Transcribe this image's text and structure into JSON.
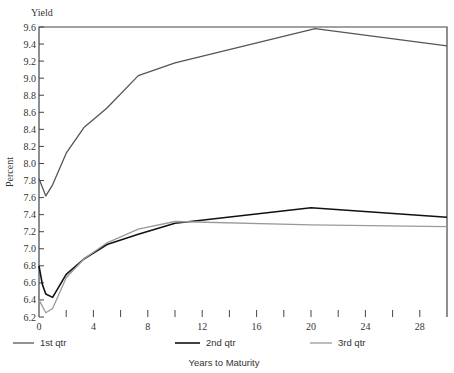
{
  "chart_data": {
    "type": "line",
    "title": "",
    "ylabel_top": "Yield",
    "ylabel": "Percent",
    "xlabel": "Years to Maturity",
    "xlim": [
      0,
      30
    ],
    "ylim": [
      6.2,
      9.6
    ],
    "x_ticks": [
      0,
      2,
      4,
      6,
      8,
      10,
      12,
      14,
      16,
      18,
      20,
      22,
      24,
      26,
      28
    ],
    "x_tick_labels": [
      "0",
      "4",
      "8",
      "12",
      "16",
      "20",
      "24",
      "28"
    ],
    "x_tick_label_values": [
      0,
      4,
      8,
      12,
      16,
      20,
      24,
      28
    ],
    "y_ticks": [
      6.2,
      6.4,
      6.6,
      6.8,
      7.0,
      7.2,
      7.4,
      7.6,
      7.8,
      8.0,
      8.2,
      8.4,
      8.6,
      8.8,
      9.0,
      9.2,
      9.4,
      9.6
    ],
    "y_tick_labels": [
      "6.2",
      "6.4",
      "6.6",
      "6.8",
      "7.0",
      "7.2",
      "7.4",
      "7.6",
      "7.8",
      "8.0",
      "8.2",
      "8.4",
      "8.6",
      "8.8",
      "9.0",
      "9.2",
      "9.4",
      "9.6"
    ],
    "grid": false,
    "legend_position": "bottom",
    "series": [
      {
        "name": "1st qtr",
        "color": "#555555",
        "width": 1.3,
        "points": [
          [
            0,
            7.82
          ],
          [
            0.5,
            7.62
          ],
          [
            1,
            7.75
          ],
          [
            2,
            8.12
          ],
          [
            3.3,
            8.42
          ],
          [
            5,
            8.65
          ],
          [
            7.3,
            9.03
          ],
          [
            10,
            9.18
          ],
          [
            20.3,
            9.58
          ],
          [
            30,
            9.38
          ]
        ]
      },
      {
        "name": "2nd qtr",
        "color": "#111111",
        "width": 1.6,
        "points": [
          [
            0,
            6.8
          ],
          [
            0.25,
            6.58
          ],
          [
            0.5,
            6.47
          ],
          [
            1,
            6.43
          ],
          [
            2,
            6.7
          ],
          [
            3.3,
            6.88
          ],
          [
            5,
            7.05
          ],
          [
            7.3,
            7.17
          ],
          [
            10,
            7.3
          ],
          [
            20,
            7.48
          ],
          [
            30,
            7.37
          ]
        ]
      },
      {
        "name": "3rd qtr",
        "color": "#9a9a9a",
        "width": 1.3,
        "points": [
          [
            0,
            6.4
          ],
          [
            0.5,
            6.25
          ],
          [
            1,
            6.3
          ],
          [
            2,
            6.66
          ],
          [
            3.3,
            6.88
          ],
          [
            5,
            7.07
          ],
          [
            7.3,
            7.23
          ],
          [
            10,
            7.32
          ],
          [
            20,
            7.28
          ],
          [
            30,
            7.26
          ]
        ]
      }
    ]
  },
  "legend": {
    "items": [
      {
        "label": "1st qtr"
      },
      {
        "label": "2nd qtr"
      },
      {
        "label": "3rd qtr"
      }
    ]
  },
  "axes": {
    "y_title_top": "Yield",
    "y_title_side": "Percent",
    "x_title": "Years to Maturity"
  }
}
